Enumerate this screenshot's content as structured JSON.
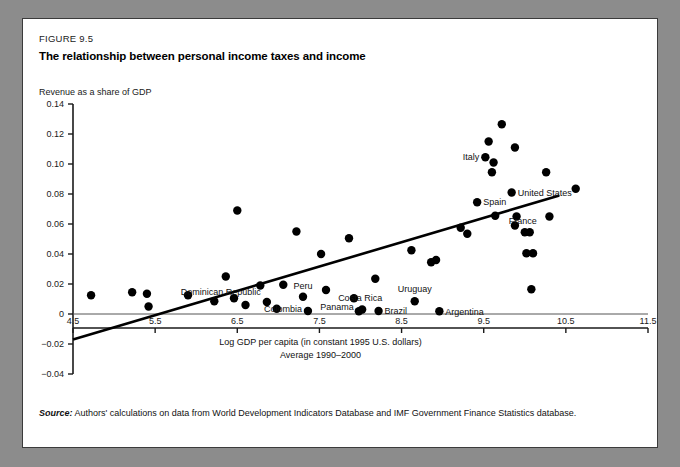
{
  "figure": {
    "number": "FIGURE 9.5",
    "title": "The relationship between personal income taxes and income",
    "source_label": "Source:",
    "source_text": "Authors' calculations on data from World Development Indicators Database and IMF Government Finance Statistics database."
  },
  "chart_data": {
    "type": "scatter",
    "title": "The relationship between personal income taxes and income",
    "xlabel": "Log GDP per capita (in constant 1995 U.S. dollars)",
    "xlabel_line2": "Average 1990–2000",
    "ylabel": "Revenue as a share of GDP",
    "xlim": [
      4.5,
      11.5
    ],
    "ylim": [
      -0.04,
      0.14
    ],
    "xticks": [
      "4.5",
      "5.5",
      "6.5",
      "7.5",
      "8.5",
      "9.5",
      "10.5",
      "11.5"
    ],
    "xtick_values": [
      4.5,
      5.5,
      6.5,
      7.5,
      8.5,
      9.5,
      10.5,
      11.5
    ],
    "yticks": [
      "0.14",
      "0.12",
      "0.10",
      "0.08",
      "0.06",
      "0.04",
      "0.02",
      "0",
      "−0.02",
      "−0.04"
    ],
    "ytick_values": [
      0.14,
      0.12,
      0.1,
      0.08,
      0.06,
      0.04,
      0.02,
      0,
      -0.02,
      -0.04
    ],
    "grid": false,
    "legend": "none",
    "marker_color": "#000000",
    "marker_size": 4.2,
    "trendline": {
      "label": "linear fit",
      "x0": 4.5,
      "y0": -0.017,
      "x1": 10.42,
      "y1": 0.079,
      "color": "#000000",
      "width": 2.6
    },
    "points": [
      {
        "x": 4.72,
        "y": 0.0125,
        "label": ""
      },
      {
        "x": 5.22,
        "y": 0.0145,
        "label": ""
      },
      {
        "x": 5.4,
        "y": 0.0135,
        "label": ""
      },
      {
        "x": 5.42,
        "y": 0.005,
        "label": ""
      },
      {
        "x": 5.9,
        "y": 0.0125,
        "label": ""
      },
      {
        "x": 6.22,
        "y": 0.0085,
        "label": ""
      },
      {
        "x": 6.36,
        "y": 0.025,
        "label": ""
      },
      {
        "x": 6.5,
        "y": 0.069,
        "label": ""
      },
      {
        "x": 6.46,
        "y": 0.0105,
        "label": ""
      },
      {
        "x": 6.6,
        "y": 0.006,
        "label": ""
      },
      {
        "x": 6.78,
        "y": 0.019,
        "label": ""
      },
      {
        "x": 6.86,
        "y": 0.008,
        "label": "Dominican Republic"
      },
      {
        "x": 6.98,
        "y": 0.0035,
        "label": ""
      },
      {
        "x": 7.06,
        "y": 0.0195,
        "label": ""
      },
      {
        "x": 7.22,
        "y": 0.055,
        "label": ""
      },
      {
        "x": 7.3,
        "y": 0.0115,
        "label": "Peru"
      },
      {
        "x": 7.36,
        "y": 0.002,
        "label": "Colombia"
      },
      {
        "x": 7.52,
        "y": 0.04,
        "label": ""
      },
      {
        "x": 7.58,
        "y": 0.016,
        "label": ""
      },
      {
        "x": 7.86,
        "y": 0.0505,
        "label": ""
      },
      {
        "x": 7.92,
        "y": 0.0105,
        "label": ""
      },
      {
        "x": 7.98,
        "y": 0.0018,
        "label": "Panama"
      },
      {
        "x": 8.02,
        "y": 0.003,
        "label": "Costa Rica"
      },
      {
        "x": 8.18,
        "y": 0.0235,
        "label": ""
      },
      {
        "x": 8.22,
        "y": 0.002,
        "label": "Brazil"
      },
      {
        "x": 8.62,
        "y": 0.0425,
        "label": ""
      },
      {
        "x": 8.66,
        "y": 0.0085,
        "label": "Uruguay"
      },
      {
        "x": 8.86,
        "y": 0.0345,
        "label": ""
      },
      {
        "x": 8.92,
        "y": 0.036,
        "label": ""
      },
      {
        "x": 8.96,
        "y": 0.0018,
        "label": "Argentina"
      },
      {
        "x": 9.22,
        "y": 0.0575,
        "label": ""
      },
      {
        "x": 9.3,
        "y": 0.0535,
        "label": ""
      },
      {
        "x": 9.42,
        "y": 0.0745,
        "label": "Spain"
      },
      {
        "x": 9.52,
        "y": 0.1045,
        "label": "Italy"
      },
      {
        "x": 9.56,
        "y": 0.115,
        "label": ""
      },
      {
        "x": 9.62,
        "y": 0.101,
        "label": ""
      },
      {
        "x": 9.6,
        "y": 0.0945,
        "label": ""
      },
      {
        "x": 9.64,
        "y": 0.0655,
        "label": ""
      },
      {
        "x": 9.72,
        "y": 0.1265,
        "label": ""
      },
      {
        "x": 9.88,
        "y": 0.111,
        "label": ""
      },
      {
        "x": 9.84,
        "y": 0.081,
        "label": "United States"
      },
      {
        "x": 9.9,
        "y": 0.065,
        "label": ""
      },
      {
        "x": 9.88,
        "y": 0.059,
        "label": ""
      },
      {
        "x": 10.0,
        "y": 0.0545,
        "label": "France"
      },
      {
        "x": 10.06,
        "y": 0.0545,
        "label": ""
      },
      {
        "x": 10.02,
        "y": 0.0405,
        "label": ""
      },
      {
        "x": 10.1,
        "y": 0.0405,
        "label": ""
      },
      {
        "x": 10.08,
        "y": 0.0165,
        "label": ""
      },
      {
        "x": 10.26,
        "y": 0.0945,
        "label": ""
      },
      {
        "x": 10.3,
        "y": 0.065,
        "label": ""
      },
      {
        "x": 10.62,
        "y": 0.0835,
        "label": ""
      }
    ]
  }
}
